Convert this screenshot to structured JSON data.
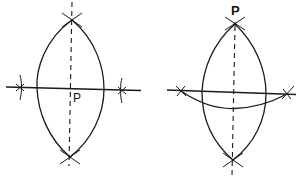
{
  "figures": [
    {
      "id": "left",
      "description": "Perpendicular bisector construction through point P on a line",
      "point_label": "P",
      "elements": [
        "lens-arcs",
        "dashed-perpendicular",
        "horizontal-line",
        "arc-crosses"
      ]
    },
    {
      "id": "right",
      "description": "Perpendicular from external point P to a line",
      "point_label": "P",
      "elements": [
        "lens-arcs",
        "dashed-perpendicular",
        "horizontal-line",
        "lower-arc",
        "arc-crosses"
      ]
    }
  ],
  "colors": {
    "ink": "#1a1a1a",
    "background": "#ffffff"
  }
}
